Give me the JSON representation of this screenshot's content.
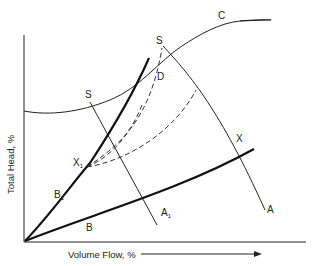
{
  "diagram": {
    "axes": {
      "x_label": "Volume Flow, %",
      "y_label": "Total Head, %"
    },
    "curve_labels": {
      "C": "C",
      "S_left": "S",
      "S_top": "S",
      "D": "D",
      "X1": "X",
      "X1_sub": "1",
      "X": "X",
      "B1": "B",
      "B1_sub": "1",
      "B": "B",
      "A1": "A",
      "A1_sub": "1",
      "A": "A"
    },
    "colors": {
      "line": "#222222",
      "background": "#ffffff"
    }
  }
}
